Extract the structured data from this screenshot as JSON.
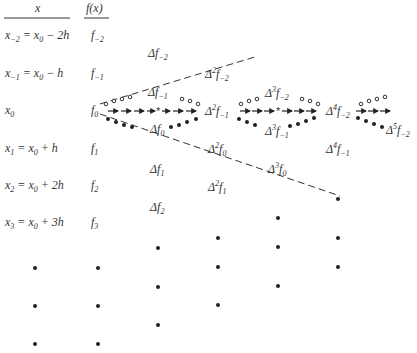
{
  "header": {
    "x": "x",
    "fx": "f(x)"
  },
  "rows": [
    {
      "x": "x",
      "xsub": "−2",
      "xrhs": " = x",
      "xrhs_sub": "0",
      "xtail": " − 2h",
      "f": "f",
      "fsub": "−2"
    },
    {
      "x": "x",
      "xsub": "−1",
      "xrhs": " = x",
      "xrhs_sub": "0",
      "xtail": " − h",
      "f": "f",
      "fsub": "−1"
    },
    {
      "x": "x",
      "xsub": "0",
      "xrhs": "",
      "xrhs_sub": "",
      "xtail": "",
      "f": "f",
      "fsub": "0"
    },
    {
      "x": "x",
      "xsub": "1",
      "xrhs": " = x",
      "xrhs_sub": "0",
      "xtail": " + h",
      "f": "f",
      "fsub": "1"
    },
    {
      "x": "x",
      "xsub": "2",
      "xrhs": " = x",
      "xrhs_sub": "0",
      "xtail": " + 2h",
      "f": "f",
      "fsub": "2"
    },
    {
      "x": "x",
      "xsub": "3",
      "xrhs": " = x",
      "xrhs_sub": "0",
      "xtail": " + 3h",
      "f": "f",
      "fsub": "3"
    }
  ],
  "differences": [
    {
      "order": "",
      "sub": "−2",
      "label": "Δf"
    },
    {
      "order": "",
      "sub": "−1",
      "label": "Δf"
    },
    {
      "order": "",
      "sub": "0",
      "label": "Δf"
    },
    {
      "order": "",
      "sub": "1",
      "label": "Δf"
    },
    {
      "order": "",
      "sub": "2",
      "label": "Δf"
    },
    {
      "order": "2",
      "sub": "−2",
      "label": "Δ²f"
    },
    {
      "order": "2",
      "sub": "−1",
      "label": "Δ²f"
    },
    {
      "order": "2",
      "sub": "0",
      "label": "Δ²f"
    },
    {
      "order": "2",
      "sub": "1",
      "label": "Δ²f"
    },
    {
      "order": "3",
      "sub": "−2",
      "label": "Δ³f"
    },
    {
      "order": "3",
      "sub": "−1",
      "label": "Δ³f"
    },
    {
      "order": "3",
      "sub": "0",
      "label": "Δ³f"
    },
    {
      "order": "4",
      "sub": "−2",
      "label": "Δ⁴f"
    },
    {
      "order": "4",
      "sub": "−1",
      "label": "Δ⁴f"
    },
    {
      "order": "5",
      "sub": "−2",
      "label": "Δ⁵f"
    }
  ],
  "legend": {
    "open_circles": "upper zigzag path (backward differences)",
    "filled_circles": "lower zigzag path (forward differences)",
    "arrows": "horizontal path (central / Stirling)",
    "dashed_lines": "diagonal paths"
  }
}
